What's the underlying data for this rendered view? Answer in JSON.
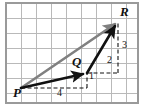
{
  "figure": {
    "width": 143,
    "height": 106,
    "background": "#ffffff"
  },
  "grid": {
    "line_color": "#b9b9b9",
    "border_color": "#9a9a9a",
    "cell_size": 15,
    "cols": 8,
    "rows": 6,
    "origin_x": 6,
    "origin_y": 3
  },
  "points": [
    {
      "id": "P",
      "label": "P",
      "x": 21,
      "y": 88,
      "label_x": 13,
      "label_y": 86
    },
    {
      "id": "Q",
      "label": "Q",
      "x": 87,
      "y": 73,
      "label_x": 72,
      "label_y": 55
    },
    {
      "id": "R",
      "label": "R",
      "x": 118,
      "y": 21,
      "label_x": 120,
      "label_y": 5
    }
  ],
  "vectors": [
    {
      "id": "PQ",
      "from": "P",
      "to": "Q",
      "color": "#111111",
      "style": "solid-arrow",
      "width": 2.6
    },
    {
      "id": "QR",
      "from": "Q",
      "to": "R",
      "color": "#111111",
      "style": "solid-arrow",
      "width": 2.6
    },
    {
      "id": "PR",
      "from": "P",
      "to": "R",
      "color": "#808080",
      "style": "solid-arrow",
      "width": 2.6
    }
  ],
  "components": [
    {
      "id": "PQ-x",
      "label": "4",
      "orientation": "horizontal",
      "from_x": 21,
      "from_y": 88,
      "to_x": 87,
      "to_y": 88,
      "label_x": 57,
      "label_y": 88
    },
    {
      "id": "PQ-y",
      "label": "1",
      "orientation": "vertical",
      "from_x": 87,
      "from_y": 88,
      "to_x": 87,
      "to_y": 73,
      "label_x": 89,
      "label_y": 71
    },
    {
      "id": "QR-x",
      "label": "2",
      "orientation": "horizontal",
      "from_x": 87,
      "from_y": 73,
      "to_x": 118,
      "to_y": 73,
      "label_x": 107,
      "label_y": 55
    },
    {
      "id": "QR-y",
      "label": "3",
      "orientation": "vertical",
      "from_x": 118,
      "from_y": 73,
      "to_x": 118,
      "to_y": 21,
      "label_x": 122,
      "label_y": 40
    }
  ],
  "dash": {
    "color": "#111111",
    "pattern": "4,2.5",
    "width": 1.1
  },
  "colors": {
    "ink": "#111111",
    "gray_vector": "#808080",
    "grid": "#b9b9b9",
    "border": "#9a9a9a"
  }
}
